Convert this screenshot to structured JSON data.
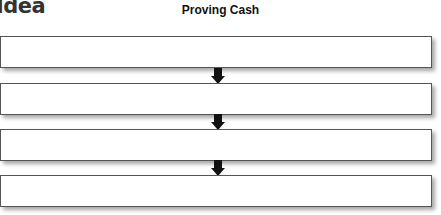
{
  "heading": "Idea",
  "diagram": {
    "title": "Proving Cash",
    "boxes": [
      {
        "text": ""
      },
      {
        "text": ""
      },
      {
        "text": ""
      },
      {
        "text": ""
      }
    ],
    "arrows": 3
  }
}
